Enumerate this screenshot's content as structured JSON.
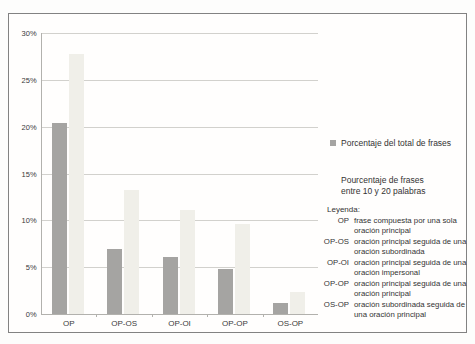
{
  "chart_data": {
    "type": "bar",
    "categories": [
      "OP",
      "OP-OS",
      "OP-OI",
      "OP-OP",
      "OS-OP"
    ],
    "series": [
      {
        "name": "Porcentaje del total de frases",
        "color": "#a5a4a2",
        "values": [
          20.4,
          6.9,
          6.1,
          4.8,
          1.2
        ]
      },
      {
        "name": "Pourcentaje de frases entre 10 y 20 palabras",
        "color": "#f0efe9",
        "values": [
          27.8,
          13.2,
          11.1,
          9.6,
          2.3
        ]
      }
    ],
    "title": "",
    "xlabel": "",
    "ylabel": "",
    "ylim": [
      0,
      30
    ],
    "ytick_step": 5,
    "ytick_labels": [
      "0%",
      "5%",
      "10%",
      "15%",
      "20%",
      "25%",
      "30%"
    ],
    "grid": true,
    "legend_position": "right"
  },
  "legend": {
    "series1_label": "Porcentaje del total de frases",
    "series2_label": "Pourcentaje de frases\nentre 10 y 20 palabras",
    "key_title": "Leyenda:",
    "entries": [
      {
        "term": "OP",
        "definition": "frase compuesta por una sola\noración principal"
      },
      {
        "term": "OP-OS",
        "definition": "oración principal seguida de una\noración subordinada"
      },
      {
        "term": "OP-OI",
        "definition": "oración principal seguida de una\noración impersonal"
      },
      {
        "term": "OP-OP",
        "definition": "oración principal seguida de una\noración principal"
      },
      {
        "term": "OS-OP",
        "definition": "oración subordinada seguida de\nuna oración principal"
      }
    ]
  },
  "colors": {
    "series1": "#a5a4a2",
    "series2": "#f0efe9",
    "gridline": "#d2d1cd",
    "frame_border": "#828282"
  }
}
